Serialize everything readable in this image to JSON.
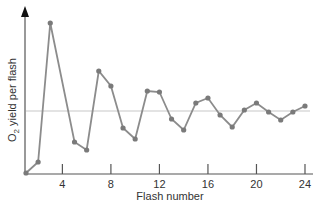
{
  "chart_data": {
    "type": "line",
    "title": "",
    "xlabel": "Flash number",
    "ylabel_main": "O",
    "ylabel_sub": "2",
    "ylabel_rest": " yield per flash",
    "ylabel": "O2 yield per flash",
    "x_ticks": [
      4,
      8,
      12,
      16,
      20,
      24
    ],
    "xlim": [
      1,
      25
    ],
    "ylim": [
      0,
      155
    ],
    "reference_line": 62,
    "grid": false,
    "legend": null,
    "series": [
      {
        "name": "O2 yield",
        "x": [
          1,
          2,
          3,
          5,
          6,
          7,
          8,
          9,
          10,
          11,
          12,
          13,
          14,
          15,
          16,
          17,
          18,
          19,
          20,
          21,
          22,
          23,
          24
        ],
        "values": [
          0,
          11,
          150,
          31,
          23,
          102,
          87,
          45,
          34,
          82,
          81,
          54,
          43,
          70,
          75,
          58,
          46,
          63,
          70,
          61,
          53,
          61,
          67
        ]
      }
    ],
    "colors": {
      "line": "#8c8c8c",
      "marker": "#7a7a7a",
      "axis": "#555555",
      "reference": "#c8c8c8"
    }
  }
}
